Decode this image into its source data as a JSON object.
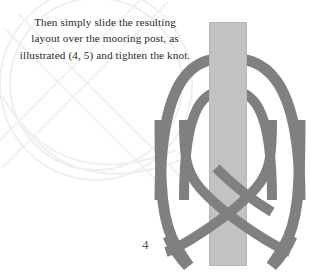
{
  "page": {
    "background_color": "#ffffff",
    "page_number": "4"
  },
  "caption": {
    "line_1": "Then simply slide the resulting",
    "line_2": "layout over the mooring post, as",
    "line_3": "illustrated (4, 5) and tighten the knot.",
    "full_text": "Then simply slide the resulting layout over the mooring post, as illustrated (4, 5) and tighten the knot.",
    "text_color": "#2b2b2b"
  },
  "illustration": {
    "title": "cow-hitch-over-mooring-post",
    "figure_label": "4",
    "post": {
      "label": "mooring post",
      "color": "#c2c2c2",
      "edge_color": "#b4b4b4",
      "left": 209,
      "right": 247,
      "top": 22,
      "bottom": 266
    },
    "rope": {
      "label": "rope",
      "color": "#808080",
      "edge_color": "#6e6e6e",
      "stroke_width": 11,
      "inner_stroke_width": 10
    },
    "watermark": {
      "label": "faint circular watermark",
      "color": "#f2f0ee",
      "circle_center_x": 96,
      "circle_center_y": 84,
      "circle_radius": 96
    }
  }
}
